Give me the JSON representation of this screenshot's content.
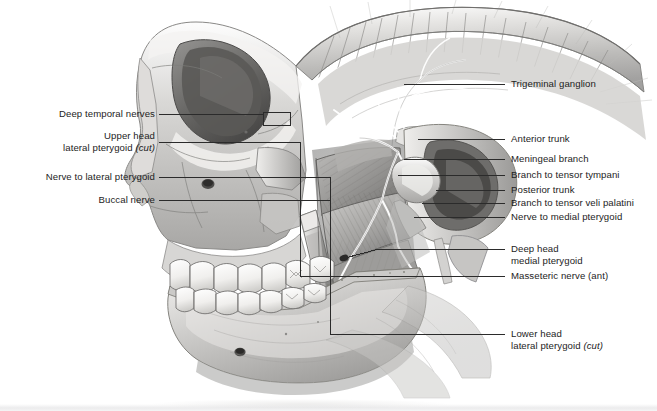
{
  "figure": {
    "background_color": "#ffffff",
    "label_color": "#1d1d1d",
    "leader_color": "#2b2b2b"
  },
  "labels_left": [
    {
      "id": "deep-temporal-nerves",
      "lines": [
        "Deep temporal nerves"
      ],
      "italic_tail": ""
    },
    {
      "id": "upper-head-lateral-pterygoid",
      "lines": [
        "Upper head",
        "lateral pterygoid "
      ],
      "italic_tail": "(cut)"
    },
    {
      "id": "nerve-to-lateral-pterygoid",
      "lines": [
        "Nerve to lateral pterygoid"
      ],
      "italic_tail": ""
    },
    {
      "id": "buccal-nerve",
      "lines": [
        "Buccal nerve"
      ],
      "italic_tail": ""
    }
  ],
  "labels_right": [
    {
      "id": "trigeminal-ganglion",
      "lines": [
        "Trigeminal ganglion"
      ],
      "italic_tail": ""
    },
    {
      "id": "anterior-trunk",
      "lines": [
        "Anterior trunk"
      ],
      "italic_tail": ""
    },
    {
      "id": "meningeal-branch",
      "lines": [
        "Meningeal branch"
      ],
      "italic_tail": ""
    },
    {
      "id": "branch-to-tensor-tympani",
      "lines": [
        "Branch to tensor tympani"
      ],
      "italic_tail": ""
    },
    {
      "id": "posterior-trunk",
      "lines": [
        "Posterior trunk"
      ],
      "italic_tail": ""
    },
    {
      "id": "branch-to-tensor-veli-palatini",
      "lines": [
        "Branch to tensor veli palatini"
      ],
      "italic_tail": ""
    },
    {
      "id": "nerve-to-medial-pterygoid",
      "lines": [
        "Nerve to medial pterygoid"
      ],
      "italic_tail": ""
    },
    {
      "id": "deep-head-medial-pterygoid",
      "lines": [
        "Deep head",
        "medial pterygoid"
      ],
      "italic_tail": ""
    },
    {
      "id": "masseteric-nerve-ant",
      "lines": [
        "Masseteric nerve (ant)"
      ],
      "italic_tail": ""
    },
    {
      "id": "lower-head-lateral-pterygoid",
      "lines": [
        "Lower head",
        "lateral pterygoid "
      ],
      "italic_tail": "(cut)"
    }
  ],
  "text": {
    "deep_temporal_nerves": "Deep temporal nerves",
    "upper_head": "Upper head",
    "lateral_pterygoid_1": "lateral pterygoid ",
    "cut_1": "(cut)",
    "nerve_to_lateral_pterygoid": "Nerve to lateral pterygoid",
    "buccal_nerve": "Buccal nerve",
    "trigeminal_ganglion": "Trigeminal ganglion",
    "anterior_trunk": "Anterior trunk",
    "meningeal_branch": "Meningeal branch",
    "branch_to_tensor_tympani": "Branch to tensor tympani",
    "posterior_trunk": "Posterior trunk",
    "branch_to_tensor_veli_palatini": "Branch to tensor veli palatini",
    "nerve_to_medial_pterygoid": "Nerve to medial pterygoid",
    "deep_head": "Deep head",
    "medial_pterygoid": "medial pterygoid",
    "masseteric_nerve_ant": "Masseteric nerve (ant)",
    "lower_head": "Lower head",
    "lateral_pterygoid_2": "lateral pterygoid ",
    "cut_2": "(cut)"
  }
}
